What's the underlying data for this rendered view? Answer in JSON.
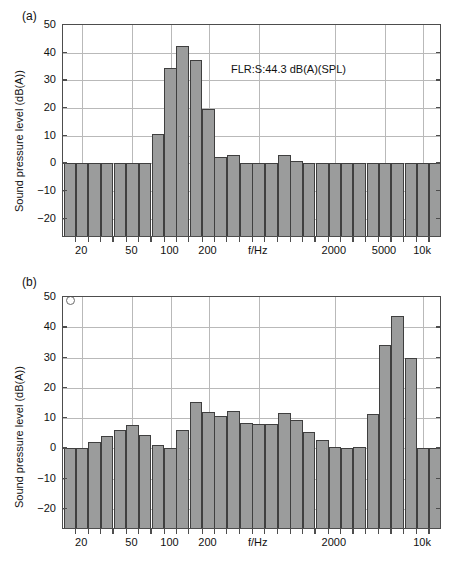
{
  "figure": {
    "panels": [
      {
        "id": "a",
        "label": "(a)",
        "annotation": "FLR:S:44.3 dB(A)(SPL)"
      },
      {
        "id": "b",
        "label": "(b)",
        "annotation": "FLR:S:44.3 dB(A)(SPL)"
      }
    ]
  },
  "chart_data": [
    {
      "type": "bar",
      "panel": "(a)",
      "title": "",
      "xlabel": "f/Hz",
      "ylabel": "Sound pressure level (dB(A))",
      "xscale": "log",
      "xlim": [
        14.1,
        14125
      ],
      "ylim": [
        -27,
        50
      ],
      "grid": true,
      "legend": null,
      "annotation": "FLR:S:44.3 dB(A)(SPL)",
      "ytick_labels": [
        "50",
        "40",
        "30",
        "20",
        "10",
        "0",
        "-10",
        "-20"
      ],
      "ytick_values": [
        50,
        40,
        30,
        20,
        10,
        0,
        -10,
        -20
      ],
      "xtick_labels": [
        "20",
        "50",
        "100",
        "200",
        "f/Hz",
        "2000",
        "5000",
        "10k"
      ],
      "xtick_values": [
        20,
        50,
        100,
        200,
        500,
        2000,
        5000,
        10000
      ],
      "categories": [
        16,
        20,
        25,
        31.5,
        40,
        50,
        63,
        80,
        100,
        125,
        160,
        200,
        250,
        315,
        400,
        500,
        630,
        800,
        1000,
        1250,
        1600,
        2000,
        2500,
        3150,
        4000,
        5000,
        6300,
        8000,
        10000,
        12500
      ],
      "values": [
        -23.5,
        -22.2,
        -6.6,
        -4.6,
        -2.1,
        -0.8,
        -3.9,
        10.6,
        34.3,
        42.5,
        37.4,
        19.6,
        2.4,
        3.2,
        0.0,
        -0.7,
        0.0,
        3.2,
        0.7,
        -3.2,
        -6.0,
        -8.2,
        -10.0,
        -12.8,
        -13.4,
        -16.1,
        -18.8,
        -20.2,
        -22.1,
        -24.8
      ]
    },
    {
      "type": "bar",
      "panel": "(b)",
      "title": "",
      "xlabel": "f/Hz",
      "ylabel": "Sound pressure level (dB(A))",
      "xscale": "log",
      "xlim": [
        14.1,
        14125
      ],
      "ylim": [
        -27,
        50
      ],
      "grid": true,
      "legend": null,
      "annotation": "FLR:S:44.3 dB(A)(SPL)",
      "marker": "open-circle-top-left",
      "ytick_labels": [
        "50",
        "40",
        "30",
        "20",
        "10",
        "0",
        "-10",
        "-20"
      ],
      "ytick_values": [
        50,
        40,
        30,
        20,
        10,
        0,
        -10,
        -20
      ],
      "xtick_labels": [
        "20",
        "50",
        "100",
        "200",
        "f/Hz",
        "2000",
        "10k"
      ],
      "xtick_values": [
        20,
        50,
        100,
        200,
        500,
        2000,
        10000
      ],
      "categories": [
        16,
        20,
        25,
        31.5,
        40,
        50,
        63,
        80,
        100,
        125,
        160,
        200,
        250,
        315,
        400,
        500,
        630,
        800,
        1000,
        1250,
        1600,
        2000,
        2500,
        3150,
        4000,
        5000,
        6300,
        8000,
        10000,
        12500
      ],
      "values": [
        -14.4,
        -13.5,
        2.1,
        4.0,
        6.2,
        7.7,
        4.4,
        1.1,
        -1.2,
        6.1,
        15.4,
        12.0,
        10.8,
        12.3,
        8.5,
        8.0,
        8.2,
        11.7,
        9.5,
        5.3,
        2.8,
        0.6,
        -0.8,
        0.3,
        11.4,
        34.3,
        43.9,
        29.7,
        -4.5,
        -16.4,
        -22.2
      ]
    }
  ]
}
